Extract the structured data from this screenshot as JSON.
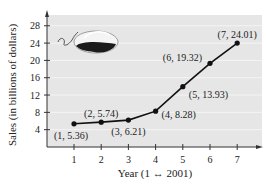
{
  "chart_data": {
    "type": "line",
    "title": "",
    "xlabel": "Year (1 ↔ 2001)",
    "ylabel": "Sales (in billions of dollars)",
    "x": [
      1,
      2,
      3,
      4,
      5,
      6,
      7
    ],
    "values": [
      5.36,
      5.74,
      6.21,
      8.28,
      13.93,
      19.32,
      24.01
    ],
    "point_labels": [
      "(1, 5.36)",
      "(2, 5.74)",
      "(3, 6.21)",
      "(4, 8.28)",
      "(5, 13.93)",
      "(6, 19.32)",
      "(7, 24.01)"
    ],
    "xticks": [
      1,
      2,
      3,
      4,
      5,
      6,
      7
    ],
    "yticks": [
      4,
      8,
      12,
      16,
      20,
      24,
      28
    ],
    "xlim": [
      0,
      7.9
    ],
    "ylim": [
      0,
      30
    ],
    "grid": true,
    "legend": null,
    "annotations": [
      "computer-mouse-illustration"
    ]
  },
  "colors": {
    "plot_background": "#e6e6e6",
    "grid": "#f4f4f4",
    "line": "#111111",
    "axis": "#333333"
  }
}
